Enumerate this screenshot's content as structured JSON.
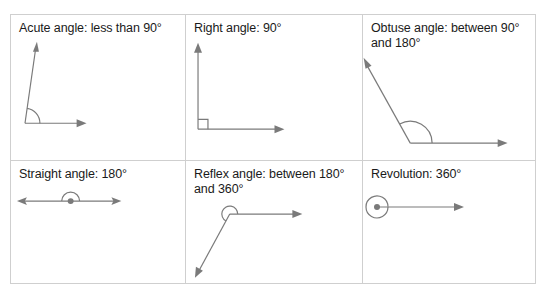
{
  "diagram": {
    "line_color": "#7a7a7a",
    "border_color": "#cfcfcf",
    "cells": [
      {
        "id": "acute",
        "label": "Acute angle: less than 90°",
        "icon": "acute-angle-icon"
      },
      {
        "id": "right",
        "label": "Right angle: 90°",
        "icon": "right-angle-icon"
      },
      {
        "id": "obtuse",
        "label": "Obtuse angle: between 90° and 180°",
        "icon": "obtuse-angle-icon"
      },
      {
        "id": "straight",
        "label": "Straight angle: 180°",
        "icon": "straight-angle-icon"
      },
      {
        "id": "reflex",
        "label": "Reflex angle: between 180° and 360°",
        "icon": "reflex-angle-icon"
      },
      {
        "id": "revolution",
        "label": "Revolution: 360°",
        "icon": "revolution-angle-icon"
      }
    ]
  }
}
